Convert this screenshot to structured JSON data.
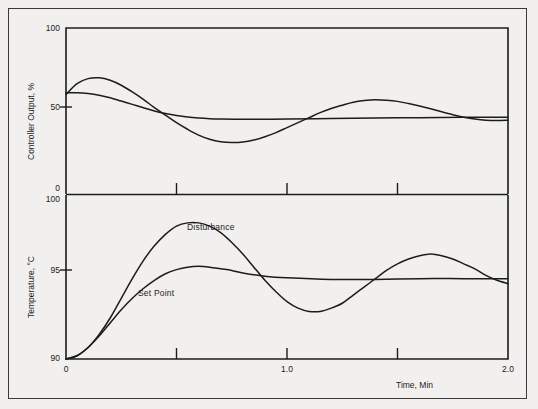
{
  "figure": {
    "background_color": "#f1f0ee",
    "frame_color": "#3a3a3a",
    "line_color": "#1c1c1c"
  },
  "chart_data": [
    {
      "type": "line",
      "panel": "top",
      "title": "",
      "xlabel": "",
      "ylabel": "Controller Output, %",
      "xlim": [
        0,
        2.0
      ],
      "ylim": [
        0,
        100
      ],
      "grid": false,
      "legend_position": "none",
      "ytick_labels": [
        "100",
        "50",
        "0"
      ],
      "ytick_values": [
        100,
        50,
        0
      ],
      "xtick_labels": [
        "",
        "",
        ""
      ],
      "xtick_values": [
        0.5,
        1.0,
        1.5
      ],
      "series": [
        {
          "name": "Disturbance",
          "x": [
            0.0,
            0.05,
            0.1,
            0.15,
            0.2,
            0.25,
            0.3,
            0.35,
            0.4,
            0.45,
            0.5,
            0.55,
            0.6,
            0.65,
            0.7,
            0.75,
            0.8,
            0.85,
            0.9,
            0.95,
            1.0,
            1.05,
            1.1,
            1.15,
            1.2,
            1.25,
            1.3,
            1.35,
            1.4,
            1.45,
            1.5,
            1.55,
            1.6,
            1.65,
            1.7,
            1.75,
            1.8,
            1.85,
            1.9,
            1.95,
            2.0
          ],
          "values": [
            60.0,
            66.5,
            69.5,
            70.0,
            68.5,
            65.5,
            61.5,
            57.0,
            52.0,
            47.5,
            43.0,
            39.0,
            35.5,
            33.0,
            31.5,
            31.0,
            31.3,
            32.5,
            34.5,
            37.0,
            40.0,
            43.0,
            46.0,
            49.0,
            51.5,
            53.5,
            55.3,
            56.3,
            56.8,
            56.5,
            55.8,
            54.5,
            53.0,
            51.3,
            49.5,
            47.8,
            46.3,
            45.2,
            44.5,
            44.3,
            44.5
          ]
        },
        {
          "name": "Set Point",
          "x": [
            0.0,
            0.05,
            0.1,
            0.15,
            0.2,
            0.25,
            0.3,
            0.35,
            0.4,
            0.45,
            0.5,
            0.55,
            0.6,
            0.65,
            0.7,
            0.8,
            0.9,
            1.0,
            1.2,
            1.4,
            1.6,
            1.8,
            2.0
          ],
          "values": [
            61.0,
            61.0,
            60.5,
            59.5,
            58.0,
            56.0,
            54.0,
            52.0,
            50.0,
            48.5,
            47.3,
            46.4,
            45.8,
            45.4,
            45.2,
            45.0,
            45.0,
            45.2,
            45.5,
            45.8,
            46.0,
            46.2,
            46.3
          ]
        }
      ]
    },
    {
      "type": "line",
      "panel": "bottom",
      "title": "",
      "xlabel": "Time, Min",
      "ylabel": "Temperature, °C",
      "xlim": [
        0,
        2.0
      ],
      "ylim": [
        90,
        100
      ],
      "grid": false,
      "legend_position": "inline-annotations",
      "ytick_labels": [
        "100",
        "95",
        "90"
      ],
      "ytick_values": [
        100,
        95,
        90
      ],
      "xtick_labels": [
        "0",
        "1.0",
        "2.0"
      ],
      "xtick_values": [
        0,
        1.0,
        2.0
      ],
      "xtick_minor_values": [
        0.5,
        1.0,
        1.5
      ],
      "annotations": [
        {
          "text": "Disturbance",
          "x": 0.62,
          "y": 98.1
        },
        {
          "text": "Set Point",
          "x": 0.4,
          "y": 94.3
        }
      ],
      "series": [
        {
          "name": "Disturbance",
          "x": [
            0.0,
            0.05,
            0.1,
            0.15,
            0.2,
            0.25,
            0.3,
            0.35,
            0.4,
            0.45,
            0.5,
            0.55,
            0.6,
            0.65,
            0.7,
            0.75,
            0.8,
            0.85,
            0.9,
            0.95,
            1.0,
            1.05,
            1.1,
            1.15,
            1.2,
            1.25,
            1.3,
            1.35,
            1.4,
            1.45,
            1.5,
            1.55,
            1.6,
            1.65,
            1.7,
            1.75,
            1.8,
            1.85,
            1.9,
            1.95,
            2.0
          ],
          "values": [
            90.0,
            90.2,
            90.7,
            91.5,
            92.5,
            93.7,
            94.9,
            96.0,
            96.9,
            97.6,
            98.1,
            98.3,
            98.3,
            98.1,
            97.7,
            97.1,
            96.4,
            95.6,
            94.8,
            94.1,
            93.5,
            93.1,
            92.9,
            92.9,
            93.1,
            93.4,
            93.9,
            94.4,
            94.9,
            95.4,
            95.8,
            96.1,
            96.3,
            96.4,
            96.3,
            96.1,
            95.8,
            95.5,
            95.1,
            94.8,
            94.6
          ]
        },
        {
          "name": "Set Point",
          "x": [
            0.0,
            0.05,
            0.1,
            0.15,
            0.2,
            0.25,
            0.3,
            0.35,
            0.4,
            0.45,
            0.5,
            0.55,
            0.6,
            0.65,
            0.7,
            0.75,
            0.8,
            0.9,
            1.0,
            1.2,
            1.4,
            1.6,
            1.8,
            2.0
          ],
          "values": [
            90.0,
            90.2,
            90.7,
            91.4,
            92.2,
            93.0,
            93.7,
            94.3,
            94.8,
            95.2,
            95.45,
            95.6,
            95.65,
            95.6,
            95.5,
            95.4,
            95.25,
            95.05,
            94.95,
            94.85,
            94.85,
            94.9,
            94.9,
            94.9
          ]
        }
      ]
    }
  ],
  "labels": {
    "top_y_axis": "Controller Output, %",
    "bottom_y_axis": "Temperature, °C",
    "x_axis": "Time, Min",
    "top_yticks": [
      "100",
      "50",
      "0"
    ],
    "bottom_yticks": [
      "100",
      "95",
      "90"
    ],
    "xticks": [
      "0",
      "1.0",
      "2.0"
    ],
    "curve_disturbance": "Disturbance",
    "curve_setpoint": "Set Point"
  }
}
